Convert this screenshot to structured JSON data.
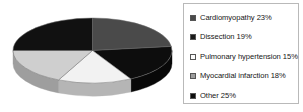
{
  "chart_data": {
    "type": "pie",
    "title": "",
    "subtitle": "",
    "xlabel": "",
    "ylabel": "",
    "legend_position": "right",
    "grid": false,
    "three_d": true,
    "categories": [
      "Cardiomyopathy",
      "Dissection",
      "Pulmonary hypertension",
      "Myocardial infarction",
      "Other"
    ],
    "values": [
      23,
      19,
      15,
      18,
      25
    ],
    "value_suffix": "%",
    "slice_colors": [
      "#4a4a4a",
      "#0d0d0d",
      "#f2f2f2",
      "#cfcfcf",
      "#111111"
    ],
    "side_colors": [
      "#3a3a3a",
      "#080808",
      "#b5b5b5",
      "#9e9e9e",
      "#0b0b0b"
    ]
  },
  "legend": {
    "items": [
      {
        "label": "Cardiomyopathy 23%",
        "color": "#4a4a4a"
      },
      {
        "label": "Dissection 19%",
        "color": "#1a1a1a"
      },
      {
        "label": "Pulmonary hypertension 15%",
        "color": "#fbfbfb"
      },
      {
        "label": "Myocardial infarction 18%",
        "color": "#9d9d9d"
      },
      {
        "label": "Other 25%",
        "color": "#0d0d0d"
      }
    ],
    "border_color": "#b9b9b9"
  }
}
